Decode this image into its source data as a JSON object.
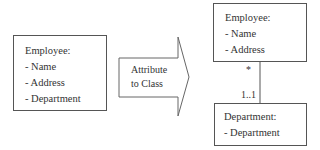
{
  "source_class": {
    "title": "Employee:",
    "attributes": [
      "- Name",
      "- Address",
      "- Department"
    ]
  },
  "transformation": {
    "label_line1": "Attribute",
    "label_line2": "to Class"
  },
  "target_classes": {
    "employee": {
      "title": "Employee:",
      "attributes": [
        "- Name",
        "- Address"
      ]
    },
    "department": {
      "title": "Department:",
      "attributes": [
        "- Department"
      ]
    }
  },
  "association": {
    "employee_multiplicity": "*",
    "department_multiplicity": "1..1"
  }
}
